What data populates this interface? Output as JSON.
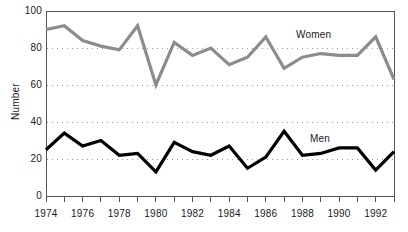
{
  "chart_data": {
    "type": "line",
    "title": "",
    "xlabel": "",
    "ylabel": "Number",
    "ylim": [
      0,
      100
    ],
    "xlim": [
      1974,
      1993
    ],
    "yticks": [
      0,
      20,
      40,
      60,
      80,
      100
    ],
    "ytick_labels": [
      "0",
      "20",
      "40",
      "60",
      "80",
      "100"
    ],
    "xticks": [
      1974,
      1975,
      1976,
      1977,
      1978,
      1979,
      1980,
      1981,
      1982,
      1983,
      1984,
      1985,
      1986,
      1987,
      1988,
      1989,
      1990,
      1991,
      1992,
      1993
    ],
    "xtick_labels": [
      "1974",
      "",
      "1976",
      "",
      "1978",
      "",
      "1980",
      "",
      "1982",
      "",
      "1984",
      "",
      "1986",
      "",
      "1988",
      "",
      "1990",
      "",
      "1992",
      ""
    ],
    "x": [
      1974,
      1975,
      1976,
      1977,
      1978,
      1979,
      1980,
      1981,
      1982,
      1983,
      1984,
      1985,
      1986,
      1987,
      1988,
      1989,
      1990,
      1991,
      1992,
      1993
    ],
    "grid": "horizontal-dotted",
    "legend_position": "inline-annotation",
    "series": [
      {
        "name": "Women",
        "color": "#8c8c8c",
        "line_width": 3.2,
        "values": [
          90,
          92,
          84,
          81,
          79,
          92,
          60,
          83,
          76,
          80,
          71,
          75,
          86,
          69,
          75,
          77,
          76,
          76,
          86,
          63
        ]
      },
      {
        "name": "Men",
        "color": "#000000",
        "line_width": 3.2,
        "values": [
          25,
          34,
          27,
          30,
          22,
          23,
          13,
          29,
          24,
          22,
          27,
          15,
          21,
          35,
          22,
          23,
          26,
          26,
          14,
          24
        ]
      }
    ],
    "annotations": [
      {
        "text": "Women",
        "x": 1989,
        "y": 88
      },
      {
        "text": "Men",
        "x": 1990,
        "y": 34
      }
    ]
  },
  "axes": {
    "y_title": "Number"
  },
  "plot_geometry": {
    "left": 46,
    "right": 394,
    "top": 11,
    "bottom": 196
  },
  "colors": {
    "women_line": "#8c8c8c",
    "men_line": "#000000",
    "axis": "#555555",
    "grid": "#9a9a9a",
    "text": "#1a1a1a",
    "background": "#ffffff"
  }
}
